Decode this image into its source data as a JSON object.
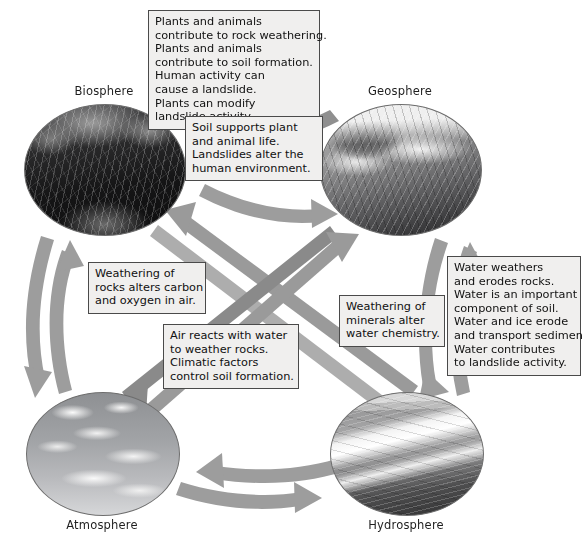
{
  "diagram": {
    "arrow_color": "#9a9a9a",
    "arrow_color_dark": "#808080",
    "callout_bg": "#f0efee",
    "callout_border": "#4a4a4a"
  },
  "spheres": [
    {
      "id": "biosphere",
      "label": "Biosphere",
      "art": "rainforest-canopy-photo"
    },
    {
      "id": "geosphere",
      "label": "Geosphere",
      "art": "snowy-mountain-glacier-photo"
    },
    {
      "id": "atmosphere",
      "label": "Atmosphere",
      "art": "clouds-in-sky-photo"
    },
    {
      "id": "hydrosphere",
      "label": "Hydrosphere",
      "art": "ocean-waves-coastline-photo"
    }
  ],
  "callouts": [
    {
      "id": "bio-to-geo",
      "lines": [
        "Plants and animals",
        "contribute to rock weathering.",
        "Plants and animals",
        "contribute to soil formation.",
        "Human activity can",
        "cause a landslide.",
        "Plants can modify",
        "landslide activity."
      ]
    },
    {
      "id": "geo-to-bio",
      "lines": [
        "Soil supports plant",
        "and animal life.",
        "Landslides alter the",
        "human environment."
      ]
    },
    {
      "id": "geo-to-atm",
      "lines": [
        "Weathering of",
        "rocks alters carbon",
        "and oxygen in air."
      ]
    },
    {
      "id": "atm-to-geo",
      "lines": [
        "Air reacts with water",
        "to weather rocks.",
        "Climatic factors",
        "control soil formation."
      ]
    },
    {
      "id": "geo-to-hyd",
      "lines": [
        "Weathering of",
        "minerals alter",
        "water chemistry."
      ]
    },
    {
      "id": "hyd-to-geo",
      "lines": [
        "Water weathers",
        "and erodes rocks.",
        "Water is an important",
        "component of soil.",
        "Water and ice erode",
        "and transport sediment.",
        "Water contributes",
        "to landslide activity."
      ]
    }
  ]
}
